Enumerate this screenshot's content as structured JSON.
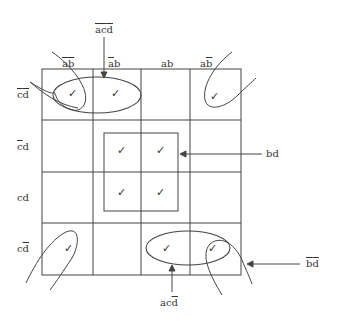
{
  "diagram": {
    "colors": {
      "line": "#444444",
      "text": "#333333",
      "background": "#ffffff"
    },
    "columns": [
      {
        "label": "ab",
        "overline": "both",
        "display": "āb̄"
      },
      {
        "label": "ab",
        "overline": "a",
        "display": "āb"
      },
      {
        "label": "ab",
        "overline": "none",
        "display": "ab"
      },
      {
        "label": "ab",
        "overline": "b",
        "display": "ab̄"
      }
    ],
    "rows": [
      {
        "label": "cd",
        "overline": "both",
        "display": "c̄d̄"
      },
      {
        "label": "cd",
        "overline": "c",
        "display": "c̄d"
      },
      {
        "label": "cd",
        "overline": "none",
        "display": "cd"
      },
      {
        "label": "cd",
        "overline": "d",
        "display": "cd̄"
      }
    ],
    "check_symbol": "✓",
    "cells_checked": [
      [
        true,
        true,
        false,
        true
      ],
      [
        false,
        true,
        true,
        false
      ],
      [
        false,
        true,
        true,
        false
      ],
      [
        true,
        false,
        true,
        true
      ]
    ],
    "groups": [
      {
        "term": "āc̄d̄",
        "display": "acd",
        "overline": "all",
        "description": "top row, columns 1-2"
      },
      {
        "term": "bd",
        "display": "bd",
        "overline": "none",
        "description": "center 2x2 block"
      },
      {
        "term": "acd̄",
        "display": "acd",
        "overline": "d",
        "description": "bottom row, columns 3-4"
      },
      {
        "term": "b̄d̄",
        "display": "bd",
        "overline": "all",
        "description": "four corners"
      }
    ]
  }
}
